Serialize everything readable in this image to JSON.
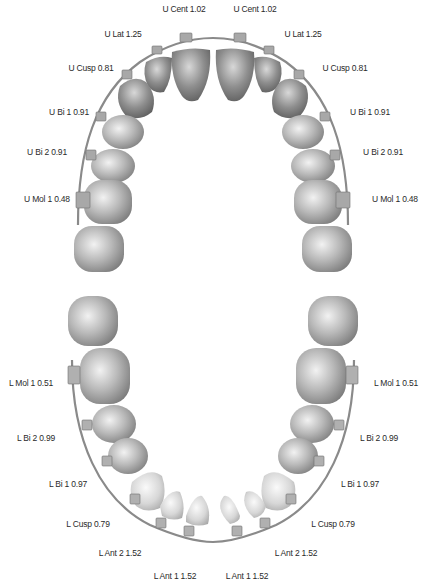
{
  "diagram": {
    "colors": {
      "background": "#ffffff",
      "label_text": "#2a2a2a",
      "upper_tooth_dark": "#6e6e6e",
      "upper_tooth_light": "#d9d9d9",
      "lower_tooth_light": "#e6e6e6",
      "archwire": "#8a8a8a",
      "bracket": "#a0a0a0"
    },
    "upper_arch": {
      "labels_left": [
        {
          "text": "U Cent 1.02",
          "x": 184,
          "y": 9
        },
        {
          "text": "U Lat 1.25",
          "x": 123,
          "y": 34
        },
        {
          "text": "U Cusp 0.81",
          "x": 91,
          "y": 68
        },
        {
          "text": "U Bi 1 0.91",
          "x": 69,
          "y": 112
        },
        {
          "text": "U Bi 2 0.91",
          "x": 47,
          "y": 152
        },
        {
          "text": "U Mol 1 0.48",
          "x": 47,
          "y": 199
        }
      ],
      "labels_right": [
        {
          "text": "U Cent 1.02",
          "x": 255,
          "y": 9
        },
        {
          "text": "U Lat 1.25",
          "x": 303,
          "y": 34
        },
        {
          "text": "U Cusp 0.81",
          "x": 345,
          "y": 68
        },
        {
          "text": "U Bi 1 0.91",
          "x": 370,
          "y": 112
        },
        {
          "text": "U Bi 2 0.91",
          "x": 383,
          "y": 152
        },
        {
          "text": "U Mol 1 0.48",
          "x": 395,
          "y": 199
        }
      ]
    },
    "lower_arch": {
      "labels_left": [
        {
          "text": "L Mol 1 0.51",
          "x": 31,
          "y": 383
        },
        {
          "text": "L Bi 2 0.99",
          "x": 36,
          "y": 438
        },
        {
          "text": "L Bi 1 0.97",
          "x": 68,
          "y": 484
        },
        {
          "text": "L Cusp 0.79",
          "x": 88,
          "y": 524
        },
        {
          "text": "L Ant 2 1.52",
          "x": 120,
          "y": 553
        },
        {
          "text": "L Ant 1 1.52",
          "x": 175,
          "y": 576
        }
      ],
      "labels_right": [
        {
          "text": "L Mol 1 0.51",
          "x": 396,
          "y": 383
        },
        {
          "text": "L Bi 2 0.99",
          "x": 379,
          "y": 438
        },
        {
          "text": "L Bi 1 0.97",
          "x": 360,
          "y": 484
        },
        {
          "text": "L Cusp 0.79",
          "x": 333,
          "y": 524
        },
        {
          "text": "L Ant 2 1.52",
          "x": 296,
          "y": 553
        },
        {
          "text": "L Ant 1 1.52",
          "x": 247,
          "y": 576
        }
      ]
    }
  }
}
